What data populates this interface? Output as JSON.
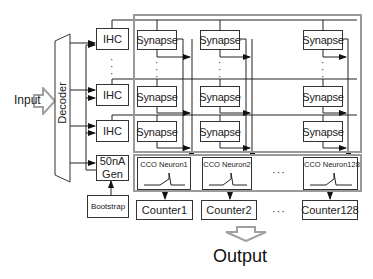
{
  "input": {
    "label": "Input"
  },
  "decoder": {
    "label": "Decoder"
  },
  "ihc_blocks": [
    {
      "label": "IHC"
    },
    {
      "label": "IHC"
    },
    {
      "label": "IHC"
    }
  ],
  "current_gen": {
    "line1": "50nA",
    "line2": "Gen"
  },
  "bootstrap": {
    "label": "Bootstrap"
  },
  "synapse_array": {
    "rows": [
      [
        "Synapse",
        "Synapse",
        "Synapse"
      ],
      [
        "Synapse",
        "Synapse",
        "Synapse"
      ],
      [
        "Synapse",
        "Synapse",
        "Synapse"
      ]
    ]
  },
  "neurons": [
    {
      "label": "CCO Neuron1"
    },
    {
      "label": "CCO Neuron2"
    },
    {
      "label": "CCO Neuron128"
    }
  ],
  "counters": [
    {
      "label": "Counter1"
    },
    {
      "label": "Counter2"
    },
    {
      "label": "Counter128"
    }
  ],
  "ellipsis": {
    "horizontal": "···",
    "vertical": "⋮"
  },
  "output": {
    "label": "Output"
  },
  "colors": {
    "line": "#222222",
    "frame": "#9a9a9a",
    "arrow_outline": "#a0a0a0"
  }
}
